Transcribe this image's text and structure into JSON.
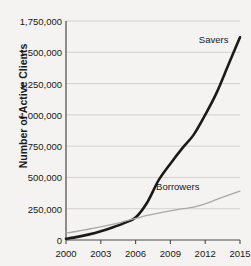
{
  "chart_data": {
    "type": "line",
    "title": "",
    "xlabel": "",
    "ylabel": "Number of Active Clients",
    "xlim": [
      2000,
      2015
    ],
    "ylim": [
      0,
      1750000
    ],
    "grid": true,
    "legend_position": "inline-annotation",
    "xticks": [
      "2000",
      "2003",
      "2006",
      "2009",
      "2012",
      "2015"
    ],
    "xtick_values": [
      2000,
      2003,
      2006,
      2009,
      2012,
      2015
    ],
    "yticks": [
      "0",
      "250,000",
      "500,000",
      "750,000",
      "1,000,000",
      "1,250,000",
      "1,500,000",
      "1,750,000"
    ],
    "ytick_values": [
      0,
      250000,
      500000,
      750000,
      1000000,
      1250000,
      1500000,
      1750000
    ],
    "x": [
      2000,
      2001,
      2002,
      2003,
      2004,
      2005,
      2006,
      2007,
      2008,
      2009,
      2010,
      2011,
      2012,
      2013,
      2014,
      2015
    ],
    "series": [
      {
        "name": "Savers",
        "color": "#1a1a1a",
        "width": 2.6,
        "values": [
          10000,
          25000,
          45000,
          70000,
          100000,
          135000,
          180000,
          300000,
          480000,
          610000,
          730000,
          840000,
          1000000,
          1180000,
          1400000,
          1620000
        ]
      },
      {
        "name": "Borrowers",
        "color": "#a8a8a8",
        "width": 1.3,
        "values": [
          55000,
          70000,
          88000,
          105000,
          125000,
          148000,
          172000,
          196000,
          215000,
          232000,
          248000,
          262000,
          288000,
          325000,
          358000,
          390000
        ]
      }
    ],
    "annotations": [
      {
        "text": "Savers",
        "x": 2014.0,
        "y": 1610000
      },
      {
        "text": "Borrowers",
        "x": 2011.5,
        "y": 430000
      }
    ]
  }
}
